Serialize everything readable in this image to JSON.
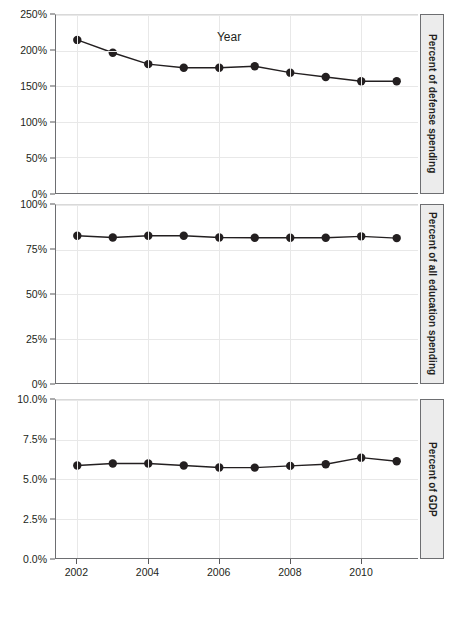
{
  "chart_data": [
    {
      "type": "line",
      "panel_label": "Percent of defense spending",
      "title": "",
      "xlabel": "Year",
      "ylabel": "Percent of defense spending",
      "x": [
        2002,
        2003,
        2004,
        2005,
        2006,
        2007,
        2008,
        2009,
        2010,
        2011
      ],
      "values": [
        215,
        197,
        181,
        176,
        176,
        178,
        169,
        163,
        157,
        157
      ],
      "ylim": [
        0,
        250
      ],
      "yticks": [
        0,
        50,
        100,
        150,
        200,
        250
      ],
      "ytick_labels": [
        "0%",
        "50%",
        "100%",
        "150%",
        "200%",
        "250%"
      ],
      "xlim": [
        2001.4,
        2011.6
      ],
      "xticks": [
        2002,
        2004,
        2006,
        2008,
        2010
      ],
      "xtick_labels": [
        "2002",
        "2004",
        "2006",
        "2008",
        "2010"
      ],
      "grid": true,
      "legend": "none",
      "marker": "filled-circle",
      "line_color": "#231f20",
      "marker_color": "#231f20"
    },
    {
      "type": "line",
      "panel_label": "Percent of all education spending",
      "title": "",
      "xlabel": "Year",
      "ylabel": "Percent of all education spending",
      "x": [
        2002,
        2003,
        2004,
        2005,
        2006,
        2007,
        2008,
        2009,
        2010,
        2011
      ],
      "values": [
        82.7,
        81.7,
        82.7,
        82.7,
        81.7,
        81.6,
        81.6,
        81.6,
        82.4,
        81.4
      ],
      "ylim": [
        0,
        100
      ],
      "yticks": [
        0,
        25,
        50,
        75,
        100
      ],
      "ytick_labels": [
        "0%",
        "25%",
        "50%",
        "75%",
        "100%"
      ],
      "xlim": [
        2001.4,
        2011.6
      ],
      "xticks": [
        2002,
        2004,
        2006,
        2008,
        2010
      ],
      "xtick_labels": [
        "2002",
        "2004",
        "2006",
        "2008",
        "2010"
      ],
      "grid": true,
      "legend": "none",
      "marker": "filled-circle",
      "line_color": "#231f20",
      "marker_color": "#231f20"
    },
    {
      "type": "line",
      "panel_label": "Percent of GDP",
      "title": "",
      "xlabel": "Year",
      "ylabel": "Percent of GDP",
      "x": [
        2002,
        2003,
        2004,
        2005,
        2006,
        2007,
        2008,
        2009,
        2010,
        2011
      ],
      "values": [
        5.85,
        5.98,
        5.98,
        5.85,
        5.73,
        5.72,
        5.83,
        5.93,
        6.35,
        6.12
      ],
      "ylim": [
        0,
        10
      ],
      "yticks": [
        0,
        2.5,
        5,
        7.5,
        10
      ],
      "ytick_labels": [
        "0.0%",
        "2.5%",
        "5.0%",
        "7.5%",
        "10.0%"
      ],
      "xlim": [
        2001.4,
        2011.6
      ],
      "xticks": [
        2002,
        2004,
        2006,
        2008,
        2010
      ],
      "xtick_labels": [
        "2002",
        "2004",
        "2006",
        "2008",
        "2010"
      ],
      "grid": true,
      "legend": "none",
      "marker": "filled-circle",
      "line_color": "#231f20",
      "marker_color": "#231f20"
    }
  ],
  "axis": {
    "x_title": "Year",
    "x_tick_labels": [
      "2002",
      "2004",
      "2006",
      "2008",
      "2010"
    ]
  },
  "strips": {
    "panel_1": "Percent of defense spending",
    "panel_2": "Percent of all education spending",
    "panel_3": "Percent of GDP"
  },
  "colors": {
    "line": "#231f20",
    "marker": "#231f20",
    "grid": "#e8e8e8",
    "axis": "#6d6e71",
    "strip_background": "#ececec",
    "background": "#ffffff"
  }
}
